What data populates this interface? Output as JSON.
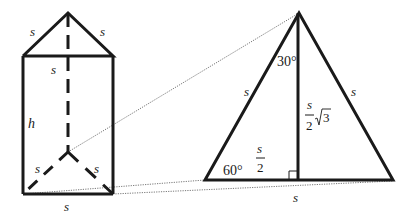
{
  "diagram": {
    "colors": {
      "stroke": "#1a1a1a",
      "dotted": "#555555",
      "background": "#ffffff"
    },
    "prism": {
      "labels": {
        "top_left_edge": "s",
        "top_right_edge": "s",
        "top_front_edge": "s",
        "height": "h",
        "base_left_edge": "s",
        "base_right_edge": "s",
        "base_front_edge": "s"
      }
    },
    "triangle": {
      "labels": {
        "left_side": "s",
        "right_side": "s",
        "base": "s",
        "apex_angle": "30°",
        "base_angle": "60°",
        "half_base_num": "s",
        "half_base_den": "2",
        "altitude_num": "s",
        "altitude_den": "2",
        "altitude_root": "3"
      }
    }
  }
}
